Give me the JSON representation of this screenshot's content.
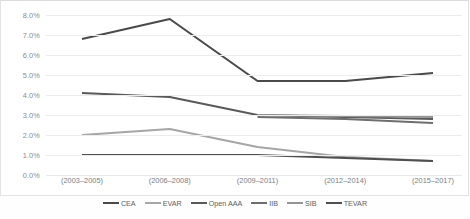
{
  "chart_data": {
    "type": "line",
    "title": "",
    "xlabel": "",
    "ylabel": "",
    "ylim": [
      0,
      8
    ],
    "ytick_labels": [
      "8.0%",
      "7.0%",
      "6.0%",
      "5.0%",
      "4.0%",
      "3.0%",
      "2.0%",
      "1.0%",
      "0.0%"
    ],
    "ytick_values": [
      8,
      7,
      6,
      5,
      4,
      3,
      2,
      1,
      0
    ],
    "grid": "horizontal",
    "legend_position": "bottom",
    "categories": [
      "(2003–2005)",
      "(2006–2008)",
      "(2009–2011)",
      "(2012–2014)",
      "(2015–2017)"
    ],
    "series": [
      {
        "name": "CEA",
        "color": "#4a4a4a",
        "values": [
          6.8,
          7.8,
          4.7,
          4.7,
          5.1
        ]
      },
      {
        "name": "EVAR",
        "color": "#a6a6a6",
        "values": [
          2.0,
          2.3,
          1.4,
          0.9,
          0.7
        ]
      },
      {
        "name": "Open AAA",
        "color": "#595959",
        "values": [
          4.1,
          3.9,
          3.0,
          2.9,
          2.8
        ]
      },
      {
        "name": "IIB",
        "color": "#6e6e6e",
        "values": [
          null,
          null,
          2.9,
          2.8,
          2.6
        ]
      },
      {
        "name": "SIB",
        "color": "#949494",
        "values": [
          null,
          null,
          3.0,
          2.95,
          2.9
        ]
      },
      {
        "name": "TEVAR",
        "color": "#4f4f4f",
        "values": [
          1.0,
          1.0,
          1.0,
          0.85,
          0.7
        ]
      }
    ]
  },
  "legend": {
    "items": [
      {
        "label": "CEA"
      },
      {
        "label": "EVAR"
      },
      {
        "label": "Open AAA"
      },
      {
        "label": "IIB"
      },
      {
        "label": "SIB"
      },
      {
        "label": "TEVAR"
      }
    ]
  },
  "caption": {
    "text": ""
  }
}
